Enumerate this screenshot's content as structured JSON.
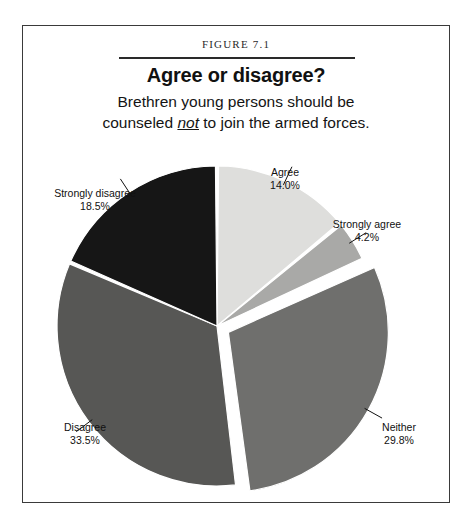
{
  "figure": {
    "number_label": "Figure 7.1",
    "title": "Agree or disagree?",
    "subtitle_line1": "Brethren young persons should be",
    "subtitle_line2_before": "counseled ",
    "subtitle_line2_emphasis": "not",
    "subtitle_line2_after": " to join the armed forces."
  },
  "chart_data": {
    "type": "pie",
    "title": "Agree or disagree?",
    "subtitle": "Brethren young persons should be counseled not to join the armed forces.",
    "start_angle_deg": 0,
    "direction": "clockwise",
    "units": "percent",
    "categories": [
      "Agree",
      "Strongly agree",
      "Neither",
      "Disagree",
      "Strongly disagree"
    ],
    "values": [
      14.0,
      4.2,
      29.8,
      33.5,
      18.5
    ],
    "value_labels": [
      "14.0%",
      "4.2%",
      "29.8%",
      "33.5%",
      "18.5%"
    ],
    "colors": [
      "#dededc",
      "#a9a9a7",
      "#6f6f6d",
      "#575755",
      "#161616"
    ],
    "exploded": [
      false,
      false,
      true,
      false,
      false
    ],
    "legend": "none",
    "grid": false,
    "slices": [
      {
        "name": "Agree",
        "value": 14.0,
        "label": "Agree",
        "value_label": "14.0%",
        "color": "#dededc",
        "exploded": false,
        "label_x": 262,
        "label_y": 42,
        "label_anchor": "middle"
      },
      {
        "name": "Strongly agree",
        "value": 4.2,
        "label": "Strongly agree",
        "value_label": "4.2%",
        "color": "#a9a9a7",
        "exploded": false,
        "label_x": 344,
        "label_y": 94,
        "label_anchor": "middle"
      },
      {
        "name": "Neither",
        "value": 29.8,
        "label": "Neither",
        "value_label": "29.8%",
        "color": "#6f6f6d",
        "exploded": true,
        "label_x": 376,
        "label_y": 297,
        "label_anchor": "middle"
      },
      {
        "name": "Disagree",
        "value": 33.5,
        "label": "Disagree",
        "value_label": "33.5%",
        "color": "#575755",
        "exploded": false,
        "label_x": 62,
        "label_y": 297,
        "label_anchor": "middle"
      },
      {
        "name": "Strongly disagree",
        "value": 18.5,
        "label": "Strongly disagree",
        "value_label": "18.5%",
        "color": "#161616",
        "exploded": false,
        "label_x": 72,
        "label_y": 63,
        "label_anchor": "middle"
      }
    ]
  }
}
